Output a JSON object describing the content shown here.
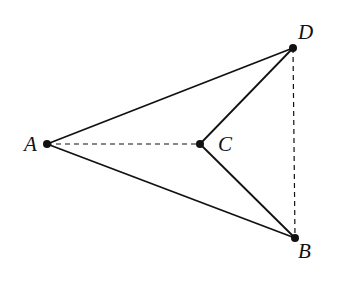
{
  "diagram": {
    "points": {
      "A": {
        "label": "A",
        "x": 47,
        "y": 144,
        "lx": 24,
        "ly": 151
      },
      "B": {
        "label": "B",
        "x": 295,
        "y": 238,
        "lx": 298,
        "ly": 258
      },
      "C": {
        "label": "C",
        "x": 200,
        "y": 144,
        "lx": 218,
        "ly": 151
      },
      "D": {
        "label": "D",
        "x": 293,
        "y": 48,
        "lx": 298,
        "ly": 39
      }
    },
    "solid_segments": [
      [
        "A",
        "D"
      ],
      [
        "A",
        "B"
      ],
      [
        "C",
        "D"
      ],
      [
        "C",
        "B"
      ]
    ],
    "dashed_segments": [
      [
        "A",
        "C"
      ],
      [
        "D",
        "B"
      ]
    ],
    "colors": {
      "stroke": "#111111",
      "background": "#ffffff"
    }
  }
}
